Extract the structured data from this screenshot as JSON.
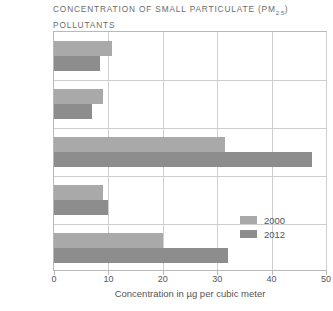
{
  "chart_data": {
    "type": "bar",
    "orientation": "horizontal",
    "title": "CONCENTRATION OF SMALL PARTICULATE (PM2.5) POLLUTANTS",
    "title_main": "CONCENTRATION OF SMALL PARTICULATE (PM",
    "title_subscript": "2.5",
    "title_after": ") POLLUTANTS",
    "categories": [
      "US",
      "Canada",
      "China",
      "Russia",
      "India"
    ],
    "series": [
      {
        "name": "2000",
        "color": "#a9a9a9",
        "values": [
          10.7,
          9.0,
          31.5,
          9.0,
          20.0
        ]
      },
      {
        "name": "2012",
        "color": "#8d8d8d",
        "values": [
          8.5,
          7.0,
          47.5,
          10.0,
          32.0
        ]
      }
    ],
    "xlabel": "Concentration in µg per cubic meter",
    "ylabel": "",
    "xticks": [
      0,
      10,
      20,
      30,
      40,
      50
    ],
    "xlim": [
      0,
      50
    ],
    "grid": true,
    "legend_position": "inside-right"
  },
  "legend": {
    "items": [
      {
        "label": "2000",
        "color": "#a9a9a9"
      },
      {
        "label": "2012",
        "color": "#8d8d8d"
      }
    ]
  },
  "colors": {
    "series_2000": "#a9a9a9",
    "series_2012": "#8d8d8d",
    "frame": "#b9b9b9",
    "grid": "#cfcfcf",
    "text": "#555555",
    "title_text": "#6b6b6b",
    "background": "#ffffff"
  }
}
